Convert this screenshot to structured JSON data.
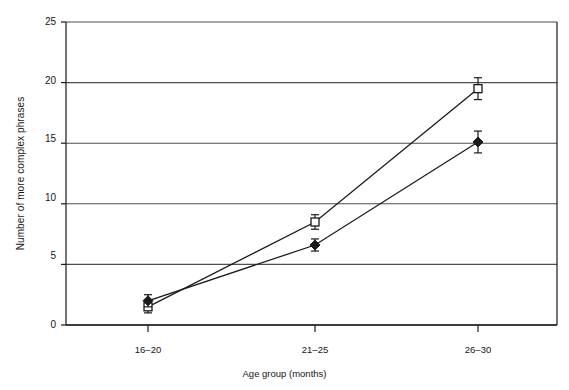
{
  "chart_data": {
    "type": "line",
    "title": "",
    "subtitle": "",
    "xlabel": "Age group (months)",
    "ylabel": "Number of more complex phrases",
    "categories": [
      "16–20",
      "21–25",
      "26–30"
    ],
    "ylim": [
      0,
      25
    ],
    "yticks": [
      0,
      5,
      10,
      15,
      20,
      25
    ],
    "ytick_labels": [
      "0",
      "5",
      "10",
      "15",
      "20",
      "25"
    ],
    "grid": "horizontal",
    "legend": "none",
    "series": [
      {
        "name": "open-square-series",
        "marker": "open-square",
        "values": [
          1.5,
          8.5,
          19.5
        ],
        "errors": [
          0.5,
          0.6,
          0.9
        ]
      },
      {
        "name": "filled-diamond-series",
        "marker": "filled-diamond",
        "values": [
          2.0,
          6.6,
          15.1
        ],
        "errors": [
          0.5,
          0.5,
          0.9
        ]
      }
    ],
    "colors": {
      "line": "#1a1a1a",
      "axis": "#1a1a1a",
      "grid": "#4d4d4d",
      "background": "#ffffff"
    }
  },
  "axis": {
    "y_tick_0": "0",
    "y_tick_1": "5",
    "y_tick_2": "10",
    "y_tick_3": "15",
    "y_tick_4": "20",
    "y_tick_5": "25",
    "x_tick_0": "16–20",
    "x_tick_1": "21–25",
    "x_tick_2": "26–30",
    "x_title": "Age group (months)",
    "y_title": "Number of more complex phrases"
  }
}
